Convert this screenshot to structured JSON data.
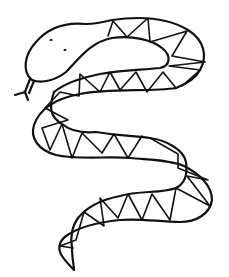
{
  "image": {
    "subject": "snake line drawing",
    "background_color": "#ffffff",
    "stroke_color": "#111111",
    "stroke_width": 2.2,
    "pattern_stroke_width": 1.6
  }
}
